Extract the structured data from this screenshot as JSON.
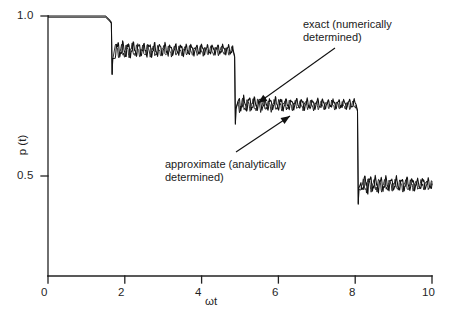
{
  "figure": {
    "background": "#ffffff",
    "ink_color": "#111111"
  },
  "chart_data": {
    "type": "line",
    "title": "",
    "subtitle": "",
    "xlabel": "ωt",
    "ylabel": "p (t)",
    "xlim": [
      0,
      10
    ],
    "ylim": [
      0,
      1.0
    ],
    "grid": false,
    "legend_position": "none",
    "x_ticks": [
      "0",
      "2",
      "4",
      "6",
      "8",
      "10"
    ],
    "x_tick_values": [
      0,
      2,
      4,
      6,
      8,
      10
    ],
    "y_ticks": [
      "0",
      "0.5",
      "1.0"
    ],
    "y_tick_values": [
      0,
      0.5,
      1.0
    ],
    "series": [
      {
        "name": "exact (numerically determined)",
        "style": "solid",
        "color": "#111111"
      },
      {
        "name": "approximate (analytically determined)",
        "style": "solid",
        "color": "#111111"
      }
    ],
    "plateaus": [
      {
        "index": 0,
        "x_start": 0.0,
        "x_end": 1.6,
        "level": 1.0,
        "ripple": 0.0
      },
      {
        "index": 1,
        "x_start": 1.75,
        "x_end": 4.82,
        "level": 0.895,
        "ripple": 0.03
      },
      {
        "index": 2,
        "x_start": 4.95,
        "x_end": 8.02,
        "level": 0.725,
        "ripple": 0.028
      },
      {
        "index": 3,
        "x_start": 8.15,
        "x_end": 10.0,
        "level": 0.475,
        "ripple": 0.03
      }
    ],
    "steps": [
      {
        "x": 1.67,
        "from": 1.0,
        "to": 0.855,
        "undershoot": 0.845
      },
      {
        "x": 4.88,
        "from": 0.88,
        "to": 0.7,
        "undershoot": 0.69
      },
      {
        "x": 8.08,
        "from": 0.71,
        "to": 0.45,
        "undershoot": 0.44
      }
    ],
    "annotations": [
      {
        "id": "exact",
        "text": "exact (numerically\ndetermined)",
        "text_x": 303,
        "text_y": 18,
        "arrow_from": [
          335,
          48
        ],
        "arrow_to": [
          258,
          103
        ]
      },
      {
        "id": "approximate",
        "text": "approximate (analytically\ndetermined)",
        "text_x": 165,
        "text_y": 158,
        "arrow_from": [
          236,
          152
        ],
        "arrow_to": [
          290,
          116
        ]
      }
    ]
  },
  "axes": {
    "y_title": "p (t)",
    "x_title": "ωt",
    "x_labels": [
      "0",
      "2",
      "4",
      "6",
      "8",
      "10"
    ],
    "y_labels": [
      "1.0",
      "0.5",
      "0"
    ]
  }
}
